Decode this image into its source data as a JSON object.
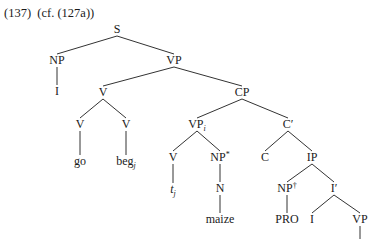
{
  "example": {
    "title": "(137)  (cf. (127a))"
  },
  "tree": {
    "nodes": [
      {
        "id": "S",
        "label": "S",
        "sub": "",
        "sup": "",
        "italic": false
      },
      {
        "id": "NP1",
        "label": "NP",
        "sub": "",
        "sup": "",
        "italic": false
      },
      {
        "id": "I1",
        "label": "I",
        "sub": "",
        "sup": "",
        "italic": false
      },
      {
        "id": "VP1",
        "label": "VP",
        "sub": "",
        "sup": "",
        "italic": false
      },
      {
        "id": "V1",
        "label": "V",
        "sub": "",
        "sup": "",
        "italic": false
      },
      {
        "id": "V2",
        "label": "V",
        "sub": "",
        "sup": "",
        "italic": false
      },
      {
        "id": "go",
        "label": "go",
        "sub": "",
        "sup": "",
        "italic": false
      },
      {
        "id": "V3",
        "label": "V",
        "sub": "",
        "sup": "",
        "italic": false
      },
      {
        "id": "beg",
        "label": "beg",
        "sub": "j",
        "sup": "",
        "italic": false
      },
      {
        "id": "CP",
        "label": "CP",
        "sub": "",
        "sup": "",
        "italic": false
      },
      {
        "id": "VPi",
        "label": "VP",
        "sub": "i",
        "sup": "",
        "italic": false
      },
      {
        "id": "V4",
        "label": "V",
        "sub": "",
        "sup": "",
        "italic": false
      },
      {
        "id": "tj",
        "label": "t",
        "sub": "j",
        "sup": "",
        "italic": true
      },
      {
        "id": "NPstar",
        "label": "NP",
        "sub": "",
        "sup": "*",
        "italic": false
      },
      {
        "id": "N",
        "label": "N",
        "sub": "",
        "sup": "",
        "italic": false
      },
      {
        "id": "maize",
        "label": "maize",
        "sub": "",
        "sup": "",
        "italic": false
      },
      {
        "id": "Cbar",
        "label": "C′",
        "sub": "",
        "sup": "",
        "italic": false
      },
      {
        "id": "C",
        "label": "C",
        "sub": "",
        "sup": "",
        "italic": false
      },
      {
        "id": "IP",
        "label": "IP",
        "sub": "",
        "sup": "",
        "italic": false
      },
      {
        "id": "NPdag",
        "label": "NP",
        "sub": "",
        "sup": "†",
        "italic": false
      },
      {
        "id": "PRO",
        "label": "PRO",
        "sub": "",
        "sup": "",
        "italic": false
      },
      {
        "id": "Ibar",
        "label": "I′",
        "sub": "",
        "sup": "",
        "italic": false
      },
      {
        "id": "I2",
        "label": "I",
        "sub": "",
        "sup": "",
        "italic": false
      },
      {
        "id": "VP2",
        "label": "VP",
        "sub": "",
        "sup": "",
        "italic": false
      }
    ],
    "edges": [
      [
        "S",
        "NP1"
      ],
      [
        "S",
        "VP1"
      ],
      [
        "NP1",
        "I1"
      ],
      [
        "VP1",
        "V1"
      ],
      [
        "VP1",
        "CP"
      ],
      [
        "V1",
        "V2"
      ],
      [
        "V1",
        "V3"
      ],
      [
        "V2",
        "go"
      ],
      [
        "V3",
        "beg"
      ],
      [
        "CP",
        "VPi"
      ],
      [
        "CP",
        "Cbar"
      ],
      [
        "VPi",
        "V4"
      ],
      [
        "VPi",
        "NPstar"
      ],
      [
        "V4",
        "tj"
      ],
      [
        "NPstar",
        "N"
      ],
      [
        "N",
        "maize"
      ],
      [
        "Cbar",
        "C"
      ],
      [
        "Cbar",
        "IP"
      ],
      [
        "IP",
        "NPdag"
      ],
      [
        "IP",
        "Ibar"
      ],
      [
        "NPdag",
        "PRO"
      ],
      [
        "Ibar",
        "I2"
      ],
      [
        "Ibar",
        "VP2"
      ],
      [
        "VP2",
        "__continues"
      ]
    ]
  }
}
